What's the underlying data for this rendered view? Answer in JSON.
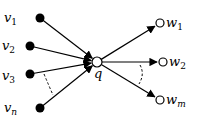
{
  "diagram": {
    "center": {
      "id": "q",
      "label": "q",
      "x": 97,
      "y": 62
    },
    "in_nodes": [
      {
        "id": "v1",
        "base": "v",
        "sub": "1",
        "x": 40,
        "y": 18,
        "lx": 4,
        "ly": 22
      },
      {
        "id": "v2",
        "base": "v",
        "sub": "2",
        "x": 30,
        "y": 46,
        "lx": 2,
        "ly": 50
      },
      {
        "id": "v3",
        "base": "v",
        "sub": "3",
        "x": 30,
        "y": 74,
        "lx": 2,
        "ly": 80
      },
      {
        "id": "vn",
        "base": "v",
        "sub": "n",
        "x": 40,
        "y": 108,
        "lx": 4,
        "ly": 112
      }
    ],
    "out_nodes": [
      {
        "id": "w1",
        "base": "w",
        "sub": "1",
        "x": 160,
        "y": 23,
        "lx": 166,
        "ly": 27
      },
      {
        "id": "w2",
        "base": "w",
        "sub": "2",
        "x": 163,
        "y": 62,
        "lx": 169,
        "ly": 66
      },
      {
        "id": "wm",
        "base": "w",
        "sub": "m",
        "x": 160,
        "y": 100,
        "lx": 166,
        "ly": 104
      }
    ],
    "in_edges_direction": "v_i -> q",
    "out_edges_direction": "q -> w_j",
    "ellipsis_arcs": [
      "between v3 and vn (dashed)",
      "between w2 and wm (dashed)"
    ],
    "colors": {
      "stroke": "#000000",
      "filled_node": "#000000",
      "hollow_node": "#ffffff"
    }
  }
}
